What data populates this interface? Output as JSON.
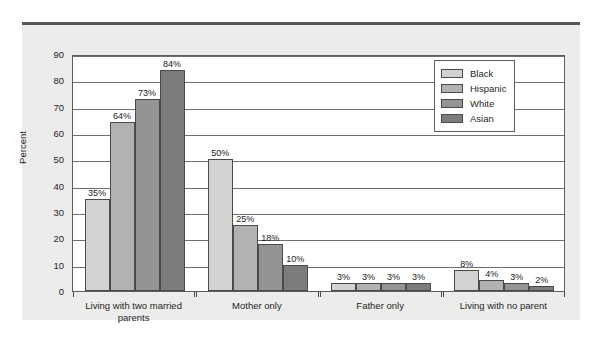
{
  "chart_data": {
    "type": "bar",
    "title": "",
    "subtitle": "",
    "xlabel": "",
    "ylabel": "Percent",
    "ylim": [
      0,
      90
    ],
    "ytick_step": 10,
    "yticks": [
      0,
      10,
      20,
      30,
      40,
      50,
      60,
      70,
      80,
      90
    ],
    "grid": true,
    "legend_position": "top-right",
    "value_suffix": "%",
    "categories": [
      "Living with two married parents",
      "Mother only",
      "Father only",
      "Living with no parent"
    ],
    "category_lines": [
      [
        "Living with two married",
        "parents"
      ],
      [
        "Mother only"
      ],
      [
        "Father only"
      ],
      [
        "Living with no parent"
      ]
    ],
    "series": [
      {
        "name": "Black",
        "color": "#d2d2d1",
        "values": [
          35,
          50,
          3,
          8
        ],
        "labels": [
          "35%",
          "50%",
          "3%",
          "8%"
        ]
      },
      {
        "name": "Hispanic",
        "color": "#b2b2b1",
        "values": [
          64,
          25,
          3,
          4
        ],
        "labels": [
          "64%",
          "25%",
          "3%",
          "4%"
        ]
      },
      {
        "name": "White",
        "color": "#949494",
        "values": [
          73,
          18,
          3,
          3
        ],
        "labels": [
          "73%",
          "18%",
          "3%",
          "3%"
        ]
      },
      {
        "name": "Asian",
        "color": "#7c7c7c",
        "values": [
          84,
          10,
          3,
          2
        ],
        "labels": [
          "84%",
          "10%",
          "3%",
          "2%"
        ]
      }
    ]
  },
  "legend": {
    "items": [
      {
        "label": "Black"
      },
      {
        "label": "Hispanic"
      },
      {
        "label": "White"
      },
      {
        "label": "Asian"
      }
    ]
  },
  "axis": {
    "y_title": "Percent",
    "y_ticks": [
      "0",
      "10",
      "20",
      "30",
      "40",
      "50",
      "60",
      "70",
      "80",
      "90"
    ]
  },
  "colors": {
    "panel_background": "#ececeb",
    "plot_background": "#ffffff",
    "axis_line": "#5d5d5d",
    "gridline": "#6f6f6f",
    "top_rule": "#56565a",
    "text": "#1f1f1f"
  }
}
